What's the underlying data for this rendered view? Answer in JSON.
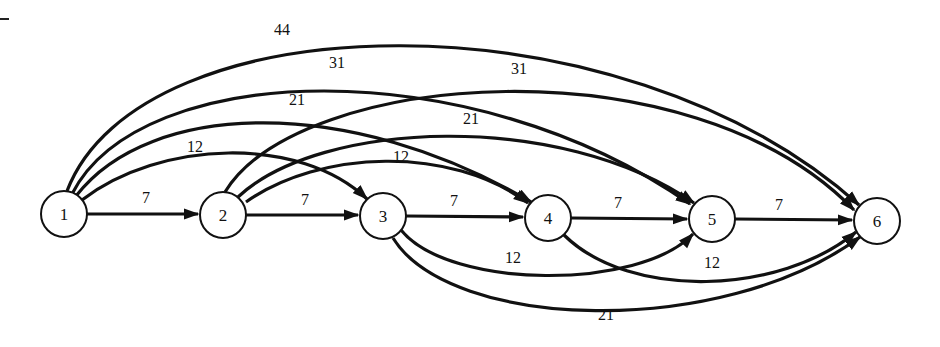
{
  "diagram": {
    "type": "directed-network",
    "nodes": [
      {
        "id": "1",
        "label": "1",
        "x": 64,
        "y": 214
      },
      {
        "id": "2",
        "label": "2",
        "x": 223,
        "y": 215
      },
      {
        "id": "3",
        "label": "3",
        "x": 383,
        "y": 216
      },
      {
        "id": "4",
        "label": "4",
        "x": 548,
        "y": 218
      },
      {
        "id": "5",
        "label": "5",
        "x": 712,
        "y": 219
      },
      {
        "id": "6",
        "label": "6",
        "x": 877,
        "y": 221
      }
    ],
    "edges": [
      {
        "from": "1",
        "to": "2",
        "weight": "7"
      },
      {
        "from": "1",
        "to": "3",
        "weight": "12"
      },
      {
        "from": "1",
        "to": "4",
        "weight": "21"
      },
      {
        "from": "1",
        "to": "5",
        "weight": "31"
      },
      {
        "from": "1",
        "to": "6",
        "weight": "44"
      },
      {
        "from": "2",
        "to": "3",
        "weight": "7"
      },
      {
        "from": "2",
        "to": "4",
        "weight": "12"
      },
      {
        "from": "2",
        "to": "5",
        "weight": "21"
      },
      {
        "from": "2",
        "to": "6",
        "weight": "31"
      },
      {
        "from": "3",
        "to": "4",
        "weight": "7"
      },
      {
        "from": "3",
        "to": "5",
        "weight": "12"
      },
      {
        "from": "3",
        "to": "6",
        "weight": "21"
      },
      {
        "from": "4",
        "to": "5",
        "weight": "7"
      },
      {
        "from": "4",
        "to": "6",
        "weight": "12"
      },
      {
        "from": "5",
        "to": "6",
        "weight": "7"
      }
    ]
  }
}
